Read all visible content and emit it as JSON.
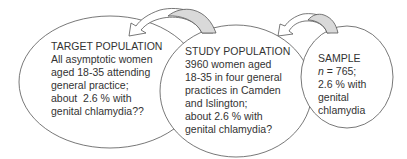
{
  "diagram": {
    "colors": {
      "outline": "#555555",
      "arrow_fill": "#d9d9d9",
      "text": "#333333"
    },
    "nodes": [
      {
        "id": "target",
        "title": "TARGET POPULATION",
        "lines": [
          "All asymptotic women",
          "aged 18-35 attending",
          "general practice;",
          "about  2.6 % with",
          "genital chlamydia??"
        ]
      },
      {
        "id": "study",
        "title": "STUDY POPULATION",
        "lines": [
          "3960 women aged",
          "18-35 in four general",
          "practices in Camden",
          "and Islington;",
          "about 2.6 % with",
          "genital chlamydia?"
        ]
      },
      {
        "id": "sample",
        "title": "SAMPLE",
        "n_symbol": "n",
        "n_value": " = 765;",
        "lines": [
          "2.6 % with",
          "genital",
          "chlamydia"
        ]
      }
    ],
    "arrows": [
      {
        "from": "study",
        "to": "target",
        "icon": "curved-arrow-icon"
      },
      {
        "from": "sample",
        "to": "study",
        "icon": "curved-arrow-icon"
      }
    ]
  }
}
